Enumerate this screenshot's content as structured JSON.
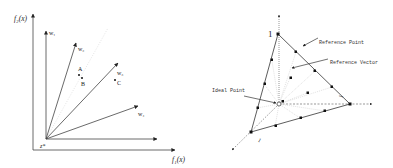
{
  "left_diagram": {
    "y_axis_label": "f₂(x)",
    "x_axis_label": "f₁(x)",
    "origin_label": "z*",
    "vectors": [
      {
        "id": "w1",
        "label": "w₁"
      },
      {
        "id": "w2",
        "label": "w₂"
      },
      {
        "id": "w3",
        "label": "w₃"
      },
      {
        "id": "w4",
        "label": "w₄"
      }
    ],
    "points": [
      {
        "id": "A",
        "label": "A"
      },
      {
        "id": "B",
        "label": "B"
      },
      {
        "id": "C",
        "label": "C"
      }
    ]
  },
  "right_diagram": {
    "apex_label": "1",
    "right_label": "1",
    "left_label": "1",
    "annotations": {
      "reference_point": "Reference Point",
      "reference_vector": "Reference Vector",
      "ideal_point": "Ideal Point"
    }
  },
  "colors": {
    "line": "#333333",
    "light_line": "#cccccc",
    "dot": "#111111"
  }
}
